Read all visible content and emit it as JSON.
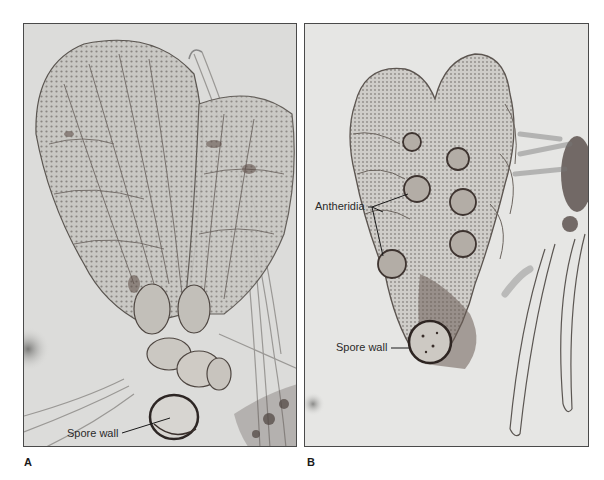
{
  "figure": {
    "panels": [
      {
        "letter": "A",
        "labels": [
          {
            "text": "Spore wall"
          }
        ]
      },
      {
        "letter": "B",
        "labels": [
          {
            "text": "Antheridia"
          },
          {
            "text": "Spore wall"
          }
        ]
      }
    ]
  }
}
